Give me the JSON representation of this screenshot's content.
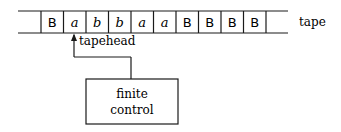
{
  "tape": {
    "label": "tape",
    "cells": [
      {
        "symbol": "B",
        "style": "sans"
      },
      {
        "symbol": "a",
        "style": "italic"
      },
      {
        "symbol": "b",
        "style": "italic"
      },
      {
        "symbol": "b",
        "style": "italic"
      },
      {
        "symbol": "a",
        "style": "italic"
      },
      {
        "symbol": "a",
        "style": "italic"
      },
      {
        "symbol": "B",
        "style": "sans"
      },
      {
        "symbol": "B",
        "style": "sans"
      },
      {
        "symbol": "B",
        "style": "sans"
      },
      {
        "symbol": "B",
        "style": "sans"
      }
    ]
  },
  "tapehead": {
    "label": "tapehead",
    "cell_index": 1
  },
  "control": {
    "line1": "finite",
    "line2": "control"
  },
  "colors": {
    "stroke": "#1a1a1a",
    "background": "#ffffff"
  }
}
